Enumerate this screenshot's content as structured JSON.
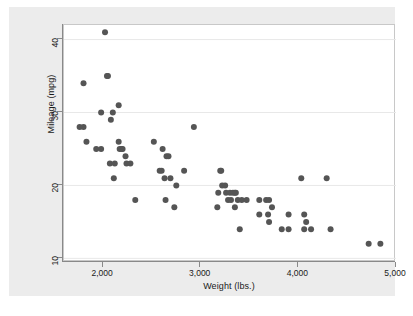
{
  "chart_data": {
    "type": "scatter",
    "title": "",
    "xlabel": "Weight (lbs.)",
    "ylabel": "Mileage (mpg)",
    "xlim": [
      1600,
      5000
    ],
    "ylim": [
      9.5,
      42
    ],
    "xticks": [
      2000,
      3000,
      4000,
      5000
    ],
    "xticklabels": [
      "2,000",
      "3,000",
      "4,000",
      "5,000"
    ],
    "yticks": [
      10,
      20,
      30,
      40
    ],
    "yticklabels": [
      "10",
      "20",
      "30",
      "40"
    ],
    "grid": "horizontal",
    "legend": "none",
    "marker": {
      "shape": "circle",
      "color": "#555555",
      "size": 3.0
    },
    "colors": {
      "graph_region": "#ececec",
      "plot_region": "#ffffff",
      "gridline": "#e8e8e8",
      "axis": "#898989",
      "text": "#1a1a1a",
      "marker": "#555555"
    },
    "n_points": 74,
    "points": [
      {
        "x": 1760,
        "y": 28
      },
      {
        "x": 1800,
        "y": 28
      },
      {
        "x": 1800,
        "y": 34
      },
      {
        "x": 1830,
        "y": 26
      },
      {
        "x": 1930,
        "y": 25
      },
      {
        "x": 1980,
        "y": 25
      },
      {
        "x": 1980,
        "y": 30
      },
      {
        "x": 2020,
        "y": 41
      },
      {
        "x": 2040,
        "y": 35
      },
      {
        "x": 2050,
        "y": 35
      },
      {
        "x": 2070,
        "y": 23
      },
      {
        "x": 2080,
        "y": 29
      },
      {
        "x": 2100,
        "y": 30
      },
      {
        "x": 2110,
        "y": 21
      },
      {
        "x": 2120,
        "y": 23
      },
      {
        "x": 2160,
        "y": 31
      },
      {
        "x": 2160,
        "y": 26
      },
      {
        "x": 2170,
        "y": 25
      },
      {
        "x": 2190,
        "y": 25
      },
      {
        "x": 2200,
        "y": 25
      },
      {
        "x": 2230,
        "y": 24
      },
      {
        "x": 2240,
        "y": 23
      },
      {
        "x": 2280,
        "y": 23
      },
      {
        "x": 2330,
        "y": 18
      },
      {
        "x": 2520,
        "y": 26
      },
      {
        "x": 2580,
        "y": 22
      },
      {
        "x": 2600,
        "y": 22
      },
      {
        "x": 2610,
        "y": 25
      },
      {
        "x": 2630,
        "y": 21
      },
      {
        "x": 2640,
        "y": 18
      },
      {
        "x": 2650,
        "y": 24
      },
      {
        "x": 2670,
        "y": 24
      },
      {
        "x": 2690,
        "y": 21
      },
      {
        "x": 2730,
        "y": 17
      },
      {
        "x": 2750,
        "y": 20
      },
      {
        "x": 2830,
        "y": 22
      },
      {
        "x": 2930,
        "y": 28
      },
      {
        "x": 3170,
        "y": 17
      },
      {
        "x": 3180,
        "y": 19
      },
      {
        "x": 3200,
        "y": 22
      },
      {
        "x": 3210,
        "y": 22
      },
      {
        "x": 3220,
        "y": 20
      },
      {
        "x": 3250,
        "y": 20
      },
      {
        "x": 3260,
        "y": 19
      },
      {
        "x": 3280,
        "y": 18
      },
      {
        "x": 3300,
        "y": 19
      },
      {
        "x": 3310,
        "y": 18
      },
      {
        "x": 3330,
        "y": 19
      },
      {
        "x": 3350,
        "y": 19
      },
      {
        "x": 3350,
        "y": 17
      },
      {
        "x": 3360,
        "y": 19
      },
      {
        "x": 3380,
        "y": 18
      },
      {
        "x": 3400,
        "y": 14
      },
      {
        "x": 3420,
        "y": 18
      },
      {
        "x": 3470,
        "y": 18
      },
      {
        "x": 3600,
        "y": 16
      },
      {
        "x": 3600,
        "y": 18
      },
      {
        "x": 3670,
        "y": 18
      },
      {
        "x": 3690,
        "y": 16
      },
      {
        "x": 3700,
        "y": 18
      },
      {
        "x": 3700,
        "y": 15
      },
      {
        "x": 3730,
        "y": 17
      },
      {
        "x": 3830,
        "y": 14
      },
      {
        "x": 3900,
        "y": 14
      },
      {
        "x": 3900,
        "y": 16
      },
      {
        "x": 4030,
        "y": 21
      },
      {
        "x": 4060,
        "y": 16
      },
      {
        "x": 4060,
        "y": 14
      },
      {
        "x": 4080,
        "y": 15
      },
      {
        "x": 4130,
        "y": 14
      },
      {
        "x": 4290,
        "y": 21
      },
      {
        "x": 4330,
        "y": 14
      },
      {
        "x": 4720,
        "y": 12
      },
      {
        "x": 4840,
        "y": 12
      }
    ]
  }
}
